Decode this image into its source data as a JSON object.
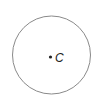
{
  "diagram": {
    "type": "circle",
    "circle": {
      "cx": 51.5,
      "cy": 55,
      "r": 39,
      "stroke": "#8a8a8a",
      "stroke_width": 1
    },
    "center_point": {
      "x": 50.5,
      "y": 57,
      "r": 1.6,
      "fill": "#222222"
    },
    "center_label": {
      "text": "C",
      "x": 55,
      "y": 61
    }
  }
}
